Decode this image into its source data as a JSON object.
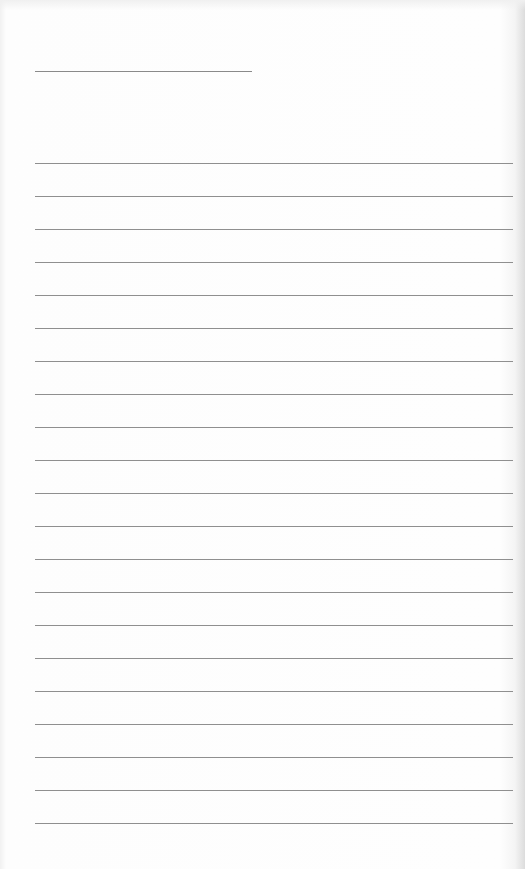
{
  "document": {
    "type": "blank lined writing sheet",
    "header_line": {
      "x": 35,
      "y": 71,
      "width": 217
    },
    "ruled_lines": {
      "count": 21,
      "first_y": 163,
      "spacing": 33,
      "x": 35,
      "width": 478
    },
    "colors": {
      "paper": "#fdfdfd",
      "line": "#8f8f8f",
      "edge_shadow": "#dcdcdc"
    }
  }
}
